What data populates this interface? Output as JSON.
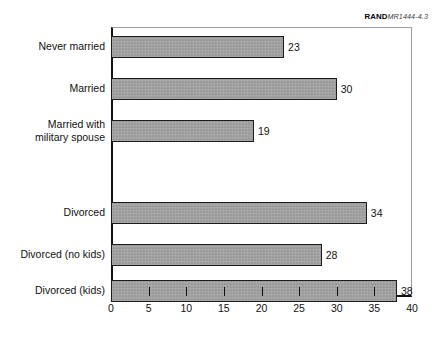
{
  "credit": {
    "organization": "RAND",
    "document_id": "MR1444-4.3"
  },
  "chart_data": {
    "type": "bar",
    "orientation": "horizontal",
    "title": "",
    "xlabel": "",
    "ylabel": "",
    "xlim": [
      0,
      40
    ],
    "xticks": [
      0,
      5,
      10,
      15,
      20,
      25,
      30,
      35,
      40
    ],
    "grid": false,
    "legend": null,
    "bar_color": "#9d9d9d",
    "bar_border_color": "#1c1c1c",
    "categories": [
      "Never married",
      "Married",
      "Married with military spouse",
      "Divorced",
      "Divorced (no kids)",
      "Divorced (kids)"
    ],
    "values": [
      23,
      30,
      19,
      34,
      28,
      38
    ],
    "value_labels": [
      "23",
      "30",
      "19",
      "34",
      "28",
      "38"
    ],
    "category_label_lines": [
      [
        "Never married"
      ],
      [
        "Married"
      ],
      [
        "Married with",
        "military spouse"
      ],
      [
        "Divorced"
      ],
      [
        "Divorced (no kids)"
      ],
      [
        "Divorced (kids)"
      ]
    ]
  }
}
